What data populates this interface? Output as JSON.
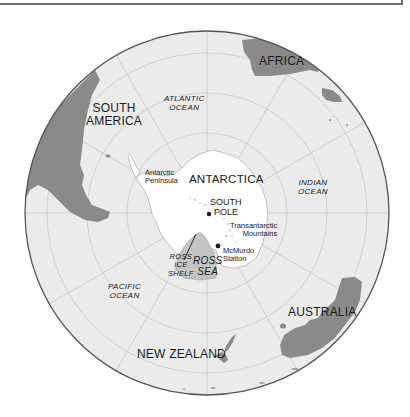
{
  "map": {
    "projection": "south-polar-azimuthal",
    "colors": {
      "ocean": "#ebebeb",
      "land": "#8a8a8a",
      "antarctica": "#ffffff",
      "ross_sea": "#c4c4c4",
      "graticule": "#c8c8c8",
      "rim": "#555555",
      "text": "#1a1a1a"
    },
    "continents": {
      "south_america": [
        "SOUTH",
        "AMERICA"
      ],
      "africa": "AFRICA",
      "antarctica": "ANTARCTICA",
      "australia": "AUSTRALIA",
      "new_zealand": "NEW ZEALAND"
    },
    "oceans": {
      "atlantic": [
        "ATLANTIC",
        "OCEAN"
      ],
      "indian": [
        "INDIAN",
        "OCEAN"
      ],
      "pacific": [
        "PACIFIC",
        "OCEAN"
      ],
      "ross_sea": [
        "ROSS",
        "SEA"
      ],
      "ross_ice_shelf": [
        "ROSS",
        "ICE",
        "SHELF"
      ]
    },
    "features": {
      "antarctic_peninsula": [
        "Antarctic",
        "Peninsula"
      ],
      "south_pole": [
        "SOUTH",
        "POLE"
      ],
      "transantarctic_mountains": [
        "Transantarctic",
        "Mountains"
      ],
      "mcmurdo_station": [
        "McMurdo",
        "Station"
      ]
    }
  }
}
